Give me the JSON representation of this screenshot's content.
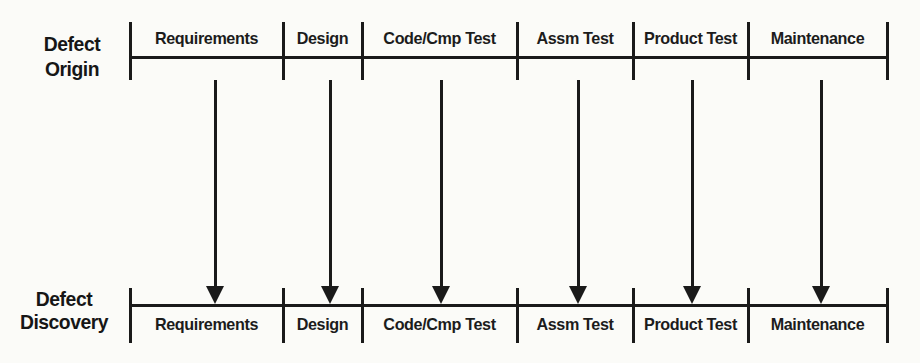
{
  "meta": {
    "background_color": "#fbfbf8",
    "ink_color": "#1a1a1a",
    "width_px": 920,
    "height_px": 363
  },
  "diagram": {
    "type": "phase-mapping-diagram",
    "top_axis": {
      "label_line1": "Defect",
      "label_line2": "Origin"
    },
    "bottom_axis": {
      "label_line1": "Defect",
      "label_line2": "Discovery"
    },
    "phases": [
      {
        "name": "Requirements",
        "x_start": 130,
        "x_end": 283,
        "arrow_x": 215
      },
      {
        "name": "Design",
        "x_start": 283,
        "x_end": 362,
        "arrow_x": 330
      },
      {
        "name": "Code/Cmp Test",
        "x_start": 362,
        "x_end": 517,
        "arrow_x": 441
      },
      {
        "name": "Assm Test",
        "x_start": 517,
        "x_end": 633,
        "arrow_x": 578
      },
      {
        "name": "Product Test",
        "x_start": 633,
        "x_end": 748,
        "arrow_x": 692
      },
      {
        "name": "Maintenance",
        "x_start": 748,
        "x_end": 887,
        "arrow_x": 821
      }
    ],
    "arrow_direction": "down"
  }
}
